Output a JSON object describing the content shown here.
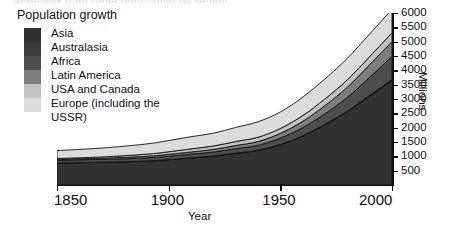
{
  "page": {
    "top_artifact_text": "appendix data table population by region"
  },
  "chart_data": {
    "type": "area",
    "title": "Population growth",
    "xlabel": "Year",
    "ylabel": "Millions",
    "xlim": [
      1850,
      2000
    ],
    "ylim": [
      0,
      6000
    ],
    "xticks": [
      1850,
      1900,
      1950,
      2000
    ],
    "yticks": [
      500,
      1000,
      1500,
      2000,
      2500,
      3000,
      3500,
      4000,
      4500,
      5000,
      5500,
      6000
    ],
    "grid": false,
    "stacked": true,
    "legend_position": "top-left",
    "x": [
      1850,
      1870,
      1890,
      1900,
      1910,
      1920,
      1930,
      1940,
      1950,
      1960,
      1970,
      1980,
      1990,
      2000
    ],
    "series": [
      {
        "name": "Europe (including the USSR)",
        "color": "#dcdcdc",
        "values": [
          275,
          310,
          355,
          390,
          425,
          445,
          490,
          540,
          575,
          640,
          700,
          750,
          790,
          820
        ]
      },
      {
        "name": "USA and Canada",
        "color": "#c2c2c2",
        "values": [
          26,
          45,
          75,
          90,
          108,
          120,
          140,
          150,
          170,
          200,
          230,
          255,
          280,
          310
        ]
      },
      {
        "name": "Latin America",
        "color": "#7d7d7d",
        "values": [
          33,
          40,
          55,
          65,
          78,
          91,
          110,
          131,
          166,
          218,
          286,
          362,
          441,
          520
        ]
      },
      {
        "name": "Africa",
        "color": "#4d4d4d",
        "values": [
          95,
          100,
          110,
          118,
          125,
          140,
          155,
          172,
          221,
          285,
          366,
          478,
          632,
          800
        ]
      },
      {
        "name": "Australasia",
        "color": "#3c3c3c",
        "values": [
          2,
          4,
          6,
          7,
          9,
          10,
          12,
          13,
          15,
          18,
          21,
          24,
          27,
          30
        ]
      },
      {
        "name": "Asia",
        "color": "#323232",
        "values": [
          769,
          790,
          830,
          880,
          940,
          1000,
          1100,
          1200,
          1400,
          1700,
          2100,
          2550,
          3100,
          3650
        ]
      }
    ],
    "legend_entries": [
      {
        "label": "Asia",
        "color": "#323232"
      },
      {
        "label": "Australasia",
        "color": "#3c3c3c"
      },
      {
        "label": "Africa",
        "color": "#4d4d4d"
      },
      {
        "label": "Latin America",
        "color": "#7d7d7d"
      },
      {
        "label": "USA and Canada",
        "color": "#c2c2c2"
      },
      {
        "label": "Europe (including the USSR)",
        "color": "#dcdcdc"
      }
    ]
  }
}
